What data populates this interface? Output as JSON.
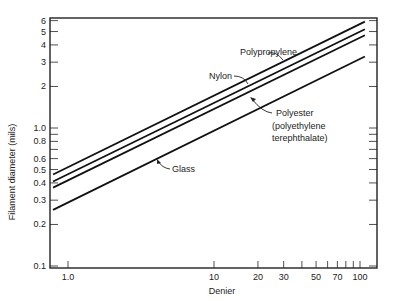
{
  "chart_data": {
    "type": "line",
    "scale": {
      "x": "log",
      "y": "log"
    },
    "title": "",
    "xlabel": "Denier",
    "ylabel": "Filament diameter (mils)",
    "xlim": [
      0.79,
      133
    ],
    "ylim": [
      0.1,
      6
    ],
    "x_ticks_labeled": [
      "1.0",
      "10",
      "20",
      "30",
      "50",
      "70",
      "100"
    ],
    "x_tick_values": [
      1,
      10,
      20,
      30,
      40,
      50,
      60,
      70,
      80,
      90,
      100
    ],
    "y_ticks_labeled": [
      "0.1",
      "0.2",
      "0.3",
      "0.4",
      "0.5",
      "0.6",
      "0.8",
      "1.0",
      "2",
      "3",
      "4",
      "5",
      "6"
    ],
    "y_tick_values": [
      0.1,
      0.2,
      0.3,
      0.4,
      0.5,
      0.6,
      0.7,
      0.8,
      0.9,
      1.0,
      2,
      3,
      4,
      5,
      6
    ],
    "grid": false,
    "legend": "inline labels with leader arrows",
    "series": [
      {
        "name": "Polypropylene",
        "x": [
          0.79,
          108
        ],
        "y": [
          0.46,
          5.9
        ]
      },
      {
        "name": "Nylon",
        "x": [
          0.79,
          108
        ],
        "y": [
          0.41,
          5.2
        ]
      },
      {
        "name": "Polyester (polyethylene terephthalate)",
        "x": [
          0.79,
          108
        ],
        "y": [
          0.37,
          4.7
        ]
      },
      {
        "name": "Glass",
        "x": [
          0.79,
          108
        ],
        "y": [
          0.255,
          3.3
        ]
      }
    ]
  },
  "labels": {
    "polypropylene": "Polypropylene",
    "nylon": "Nylon",
    "polyester_1": "Polyester",
    "polyester_2": "(polyethylene",
    "polyester_3": "terephthalate)",
    "glass": "Glass"
  },
  "axes": {
    "xlabel": "Denier",
    "ylabel": "Filament diameter (mils)",
    "y_tick_labels": [
      {
        "v": 6,
        "t": "6"
      },
      {
        "v": 5,
        "t": "5"
      },
      {
        "v": 4,
        "t": "4"
      },
      {
        "v": 3,
        "t": "3"
      },
      {
        "v": 2,
        "t": "2"
      },
      {
        "v": 1.0,
        "t": "1.0"
      },
      {
        "v": 0.8,
        "t": "0.8"
      },
      {
        "v": 0.6,
        "t": "0.6"
      },
      {
        "v": 0.5,
        "t": "0.5"
      },
      {
        "v": 0.4,
        "t": "0.4"
      },
      {
        "v": 0.3,
        "t": "0.3"
      },
      {
        "v": 0.2,
        "t": "0.2"
      },
      {
        "v": 0.1,
        "t": "0.1"
      }
    ],
    "x_tick_labels": [
      {
        "v": 1,
        "t": "1.0"
      },
      {
        "v": 10,
        "t": "10"
      },
      {
        "v": 20,
        "t": "20"
      },
      {
        "v": 30,
        "t": "30"
      },
      {
        "v": 50,
        "t": "50"
      },
      {
        "v": 70,
        "t": "70"
      },
      {
        "v": 100,
        "t": "100"
      }
    ]
  }
}
